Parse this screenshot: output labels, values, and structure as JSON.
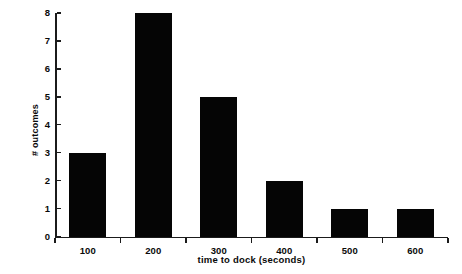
{
  "chart_data": {
    "type": "bar",
    "title": "",
    "subtitle": "",
    "xlabel": "time to dock (seconds)",
    "ylabel": "# outcomes",
    "categories": [
      "100",
      "200",
      "300",
      "400",
      "500",
      "600"
    ],
    "values": [
      3,
      8,
      5,
      2,
      1,
      1
    ],
    "series": [
      {
        "name": "# outcomes",
        "values": [
          3,
          8,
          5,
          2,
          1,
          1
        ]
      }
    ],
    "xtick_labels": [
      "100",
      "200",
      "300",
      "400",
      "500",
      "600"
    ],
    "ytick_labels": [
      "0",
      "1",
      "2",
      "3",
      "4",
      "5",
      "6",
      "7",
      "8"
    ],
    "ytick_values": [
      0,
      1,
      2,
      3,
      4,
      5,
      6,
      7,
      8
    ],
    "ylim": [
      0,
      8
    ],
    "grid": false,
    "legend": false,
    "legend_position": "none",
    "bar_color": "#050505",
    "axis_color": "#1b1b1b",
    "background_color": "#ffffff",
    "annotations": []
  }
}
